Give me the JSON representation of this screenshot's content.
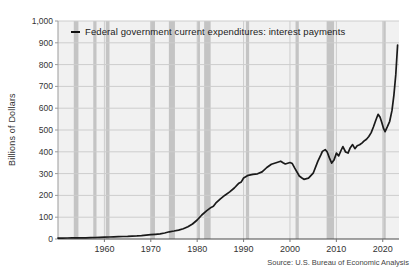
{
  "chart_data": {
    "type": "line",
    "title": "",
    "xlabel": "",
    "ylabel": "Billions of Dollars",
    "source": "Source: U.S. Bureau of Economic Analysis",
    "x_range": [
      1950,
      2023.5
    ],
    "ylim": [
      0,
      1000
    ],
    "grid": true,
    "legend_position": "top-left-inside",
    "x_ticks": [
      {
        "v": 1960,
        "label": "1960"
      },
      {
        "v": 1970,
        "label": "1970"
      },
      {
        "v": 1980,
        "label": "1980"
      },
      {
        "v": 1990,
        "label": "1990"
      },
      {
        "v": 2000,
        "label": "2000"
      },
      {
        "v": 2010,
        "label": "2010"
      },
      {
        "v": 2020,
        "label": "2020"
      }
    ],
    "y_ticks": [
      {
        "v": 0,
        "label": "0"
      },
      {
        "v": 100,
        "label": "100"
      },
      {
        "v": 200,
        "label": "200"
      },
      {
        "v": 300,
        "label": "300"
      },
      {
        "v": 400,
        "label": "400"
      },
      {
        "v": 500,
        "label": "500"
      },
      {
        "v": 600,
        "label": "600"
      },
      {
        "v": 700,
        "label": "700"
      },
      {
        "v": 800,
        "label": "800"
      },
      {
        "v": 900,
        "label": "900"
      },
      {
        "v": 1000,
        "label": "1,000"
      }
    ],
    "recession_bands": [
      [
        1953.4,
        1954.4
      ],
      [
        1957.6,
        1958.3
      ],
      [
        1960.3,
        1961.1
      ],
      [
        1969.9,
        1970.9
      ],
      [
        1973.9,
        1975.2
      ],
      [
        1980.0,
        1980.6
      ],
      [
        1981.5,
        1982.9
      ],
      [
        1990.5,
        1991.2
      ],
      [
        2001.2,
        2001.9
      ],
      [
        2007.9,
        2009.5
      ],
      [
        2020.1,
        2020.4
      ]
    ],
    "series": [
      {
        "name": "Federal government current expenditures: interest payments",
        "points": [
          [
            1950,
            4
          ],
          [
            1951,
            4.3
          ],
          [
            1952,
            4.6
          ],
          [
            1953,
            5
          ],
          [
            1954,
            5
          ],
          [
            1955,
            5.3
          ],
          [
            1956,
            5.7
          ],
          [
            1957,
            6.2
          ],
          [
            1958,
            6.8
          ],
          [
            1959,
            7.6
          ],
          [
            1960,
            8.6
          ],
          [
            1961,
            9.2
          ],
          [
            1962,
            10
          ],
          [
            1963,
            10.6
          ],
          [
            1964,
            11.3
          ],
          [
            1965,
            12
          ],
          [
            1966,
            13.2
          ],
          [
            1967,
            14.2
          ],
          [
            1968,
            15.8
          ],
          [
            1969,
            17.8
          ],
          [
            1970,
            20
          ],
          [
            1971,
            21.5
          ],
          [
            1972,
            23.5
          ],
          [
            1973,
            27.5
          ],
          [
            1974,
            33
          ],
          [
            1975,
            36.5
          ],
          [
            1976,
            41
          ],
          [
            1977,
            47
          ],
          [
            1978,
            56
          ],
          [
            1979,
            69
          ],
          [
            1980,
            87
          ],
          [
            1981,
            110
          ],
          [
            1982,
            129
          ],
          [
            1983,
            145
          ],
          [
            1983.5,
            150
          ],
          [
            1984,
            164
          ],
          [
            1985,
            184
          ],
          [
            1986,
            201
          ],
          [
            1987,
            216
          ],
          [
            1988,
            234
          ],
          [
            1989,
            256
          ],
          [
            1989.5,
            262
          ],
          [
            1990,
            280
          ],
          [
            1991,
            292
          ],
          [
            1992,
            297
          ],
          [
            1993,
            299
          ],
          [
            1994,
            308
          ],
          [
            1995,
            328
          ],
          [
            1996,
            343
          ],
          [
            1997,
            350
          ],
          [
            1998,
            357
          ],
          [
            1998.5,
            350
          ],
          [
            1999,
            344
          ],
          [
            2000,
            351
          ],
          [
            2000.5,
            346
          ],
          [
            2001,
            326
          ],
          [
            2002,
            289
          ],
          [
            2002.5,
            281
          ],
          [
            2003,
            274
          ],
          [
            2004,
            279
          ],
          [
            2005,
            302
          ],
          [
            2006,
            356
          ],
          [
            2006.7,
            388
          ],
          [
            2007,
            402
          ],
          [
            2007.6,
            410
          ],
          [
            2008,
            400
          ],
          [
            2008.5,
            372
          ],
          [
            2009,
            348
          ],
          [
            2009.5,
            362
          ],
          [
            2010,
            394
          ],
          [
            2010.5,
            381
          ],
          [
            2011,
            406
          ],
          [
            2011.4,
            424
          ],
          [
            2012,
            399
          ],
          [
            2012.5,
            394
          ],
          [
            2013,
            419
          ],
          [
            2013.5,
            433
          ],
          [
            2014,
            414
          ],
          [
            2014.5,
            428
          ],
          [
            2015,
            432
          ],
          [
            2015.5,
            440
          ],
          [
            2016,
            450
          ],
          [
            2016.5,
            458
          ],
          [
            2017,
            470
          ],
          [
            2017.5,
            488
          ],
          [
            2018,
            515
          ],
          [
            2018.5,
            545
          ],
          [
            2019,
            572
          ],
          [
            2019.4,
            560
          ],
          [
            2019.8,
            535
          ],
          [
            2020.2,
            505
          ],
          [
            2020.5,
            492
          ],
          [
            2021,
            515
          ],
          [
            2021.5,
            540
          ],
          [
            2022,
            590
          ],
          [
            2022.4,
            660
          ],
          [
            2022.8,
            755
          ],
          [
            2023.2,
            890
          ]
        ]
      }
    ],
    "colors": {
      "plot_bg": "#f1f1f1",
      "grid": "#cdcdcd",
      "recession_band": "#c4c4c4",
      "axis_left": "#9b9b9b",
      "axis_bottom": "#4a4a4a",
      "tick": "#777777",
      "tick_label": "#333333",
      "line": "#1a1a1a"
    }
  }
}
